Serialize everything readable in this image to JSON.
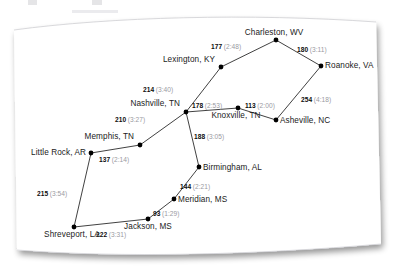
{
  "figure": {
    "type": "network-diagram",
    "card_color": "#ffffff",
    "node_color": "#000000",
    "edge_color": "#2b2b2b",
    "distance_text_color": "#0d0d0d",
    "time_text_color": "#9a9a9f"
  },
  "chart_data": {
    "type": "scatter",
    "title": "",
    "xlabel": "",
    "ylabel": "",
    "nodes": [
      {
        "id": "charleston",
        "label": "Charleston, WV",
        "x": 276,
        "y": 40,
        "label_dx": -2,
        "label_dy": -12,
        "label_anchor": "center"
      },
      {
        "id": "roanoke",
        "label": "Roanoke, VA",
        "x": 321,
        "y": 66,
        "label_dx": 4,
        "label_dy": -5,
        "label_anchor": "left"
      },
      {
        "id": "lexington",
        "label": "Lexington, KY",
        "x": 221,
        "y": 67,
        "label_dx": -6,
        "label_dy": -12,
        "label_anchor": "right"
      },
      {
        "id": "asheville",
        "label": "Asheville, NC",
        "x": 276,
        "y": 120,
        "label_dx": 4,
        "label_dy": -4,
        "label_anchor": "left"
      },
      {
        "id": "knoxville",
        "label": "Knoxville, TN",
        "x": 238,
        "y": 108,
        "label_dx": -2,
        "label_dy": 3,
        "label_anchor": "center"
      },
      {
        "id": "nashville",
        "label": "Nashville, TN",
        "x": 186,
        "y": 112,
        "label_dx": -6,
        "label_dy": -13,
        "label_anchor": "right"
      },
      {
        "id": "memphis",
        "label": "Memphis, TN",
        "x": 140,
        "y": 145,
        "label_dx": -6,
        "label_dy": -13,
        "label_anchor": "right"
      },
      {
        "id": "littlerock",
        "label": "Little Rock, AR",
        "x": 91,
        "y": 153,
        "label_dx": -5,
        "label_dy": -5,
        "label_anchor": "right"
      },
      {
        "id": "shreveport",
        "label": "Shreveport, LA",
        "x": 74,
        "y": 227,
        "label_dx": -2,
        "label_dy": 3,
        "label_anchor": "center"
      },
      {
        "id": "jackson",
        "label": "Jackson, MS",
        "x": 148,
        "y": 219,
        "label_dx": 0,
        "label_dy": 3,
        "label_anchor": "center"
      },
      {
        "id": "meridian",
        "label": "Meridian, MS",
        "x": 174,
        "y": 199,
        "label_dx": 4,
        "label_dy": -4,
        "label_anchor": "left"
      },
      {
        "id": "birmingham",
        "label": "Birmingham, AL",
        "x": 199,
        "y": 167,
        "label_dx": 4,
        "label_dy": -4,
        "label_anchor": "left"
      }
    ],
    "edges": [
      {
        "from": "lexington",
        "to": "charleston",
        "distance": "177",
        "time": "(2:48)",
        "label_x": 211,
        "label_y": 43,
        "anchor": "left"
      },
      {
        "from": "charleston",
        "to": "roanoke",
        "distance": "180",
        "time": "(3:11)",
        "label_x": 297,
        "label_y": 46,
        "anchor": "left"
      },
      {
        "from": "roanoke",
        "to": "asheville",
        "distance": "254",
        "time": "(4:18)",
        "label_x": 301,
        "label_y": 96,
        "anchor": "left"
      },
      {
        "from": "asheville",
        "to": "knoxville",
        "distance": "113",
        "time": "(2:00)",
        "label_x": 245,
        "label_y": 102,
        "anchor": "left"
      },
      {
        "from": "nashville",
        "to": "knoxville",
        "distance": "178",
        "time": "(2:53)",
        "label_x": 192,
        "label_y": 102,
        "anchor": "left"
      },
      {
        "from": "nashville",
        "to": "lexington",
        "distance": "214",
        "time": "(3:40)",
        "label_x": 143,
        "label_y": 86,
        "anchor": "left"
      },
      {
        "from": "memphis",
        "to": "nashville",
        "distance": "210",
        "time": "(3:27)",
        "label_x": 115,
        "label_y": 116,
        "anchor": "left"
      },
      {
        "from": "littlerock",
        "to": "memphis",
        "distance": "137",
        "time": "(2:14)",
        "label_x": 99,
        "label_y": 156,
        "anchor": "left"
      },
      {
        "from": "littlerock",
        "to": "shreveport",
        "distance": "215",
        "time": "(3:54)",
        "label_x": 37,
        "label_y": 190,
        "anchor": "left"
      },
      {
        "from": "shreveport",
        "to": "jackson",
        "distance": "222",
        "time": "(3:31)",
        "label_x": 96,
        "label_y": 231,
        "anchor": "left"
      },
      {
        "from": "jackson",
        "to": "meridian",
        "distance": "93",
        "time": "(1:29)",
        "label_x": 153,
        "label_y": 210,
        "anchor": "left"
      },
      {
        "from": "meridian",
        "to": "birmingham",
        "distance": "144",
        "time": "(2:21)",
        "label_x": 180,
        "label_y": 183,
        "anchor": "left"
      },
      {
        "from": "birmingham",
        "to": "nashville",
        "distance": "188",
        "time": "(3:05)",
        "label_x": 194,
        "label_y": 133,
        "anchor": "left"
      }
    ]
  }
}
